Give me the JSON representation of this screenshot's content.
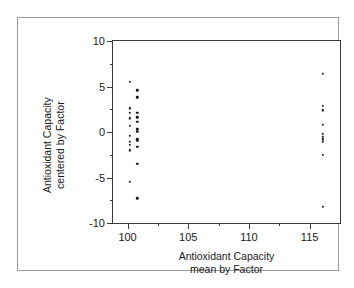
{
  "chart_data": {
    "type": "scatter",
    "title": "",
    "xlabel": "Antioxidant Capacity mean by Factor",
    "xlabel_lines": [
      "Antioxidant Capacity",
      "mean by Factor"
    ],
    "ylabel": "Antioxidant Capacity centered by Factor",
    "ylabel_lines": [
      "Antioxidant Capacity",
      "centered by Factor"
    ],
    "xlim": [
      98.8,
      117.5
    ],
    "ylim": [
      -10,
      10
    ],
    "xticks": [
      100,
      105,
      110,
      115
    ],
    "xtick_labels": [
      "100",
      "105",
      "110",
      "115"
    ],
    "xticks_minor": [
      102.5,
      107.5,
      112.5
    ],
    "yticks": [
      10,
      5,
      0,
      -5,
      -10
    ],
    "ytick_labels": [
      "10",
      "5",
      "0",
      "-5",
      "-10"
    ],
    "yticks_minor": [
      7.5,
      2.5,
      -2.5,
      -7.5
    ],
    "grid": false,
    "legend": null,
    "marker": "filled-circle",
    "marker_color": "#1a1a1a",
    "series": [
      {
        "name": "observations",
        "points": [
          [
            100.2,
            5.5
          ],
          [
            100.8,
            4.6
          ],
          [
            100.8,
            3.8
          ],
          [
            100.2,
            2.6
          ],
          [
            100.8,
            2.1
          ],
          [
            100.2,
            2.1
          ],
          [
            100.8,
            1.6
          ],
          [
            100.2,
            1.5
          ],
          [
            100.8,
            1.1
          ],
          [
            100.2,
            0.7
          ],
          [
            100.8,
            0.3
          ],
          [
            100.8,
            0.0
          ],
          [
            100.2,
            -0.4
          ],
          [
            100.8,
            -0.8
          ],
          [
            100.8,
            -1.0
          ],
          [
            100.2,
            -1.1
          ],
          [
            100.2,
            -1.4
          ],
          [
            100.8,
            -1.6
          ],
          [
            100.2,
            -2.0
          ],
          [
            100.8,
            -3.5
          ],
          [
            100.2,
            -5.5
          ],
          [
            100.8,
            -7.3
          ],
          [
            116.1,
            6.4
          ],
          [
            116.1,
            2.9
          ],
          [
            116.1,
            2.4
          ],
          [
            116.1,
            0.8
          ],
          [
            116.1,
            -0.2
          ],
          [
            116.1,
            -0.5
          ],
          [
            116.1,
            -0.8
          ],
          [
            116.1,
            -1.1
          ],
          [
            116.1,
            -2.5
          ],
          [
            116.1,
            -8.2
          ]
        ]
      }
    ]
  },
  "figure": {
    "background_color": "#ffffff",
    "frame_color": "#9a9a9a",
    "axis_color": "#3a3a3a"
  }
}
